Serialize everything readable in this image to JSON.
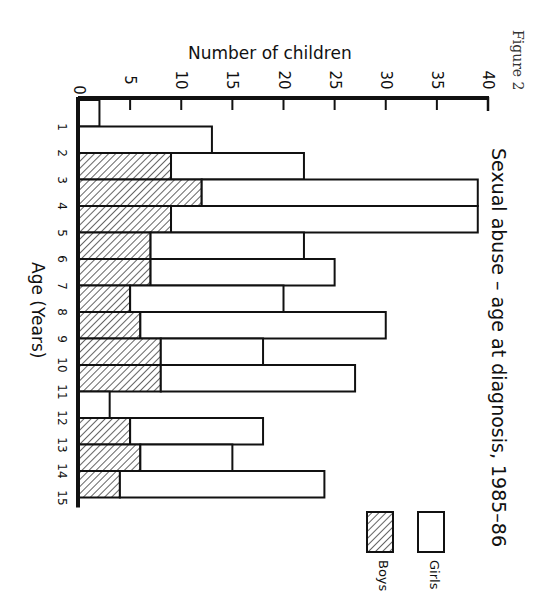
{
  "figure_label": "Figure 2",
  "chart_data": {
    "type": "bar",
    "orientation": "horizontal-stacked (page rotated 90° clockwise)",
    "title": "Sexual abuse – age at diagnosis, 1985–86",
    "xlabel": "Age (Years)",
    "ylabel": "Number of children",
    "ylim": [
      0,
      40
    ],
    "y_ticks": [
      0,
      5,
      10,
      15,
      20,
      25,
      30,
      35,
      40
    ],
    "categories": [
      "0–1",
      "1–2",
      "2–3",
      "3–4",
      "4–5",
      "5–6",
      "6–7",
      "7–8",
      "8–9",
      "9–10",
      "10–11",
      "11–12",
      "12–13",
      "13–14",
      "14–15"
    ],
    "age_tick_labels": [
      "1",
      "2",
      "3",
      "4",
      "5",
      "6",
      "7",
      "8",
      "9",
      "10",
      "11",
      "12",
      "13",
      "14",
      "15"
    ],
    "series": [
      {
        "name": "Boys",
        "pattern": "hatched",
        "values": [
          0,
          0,
          9,
          12,
          9,
          7,
          7,
          5,
          6,
          8,
          8,
          0,
          5,
          6,
          4
        ]
      },
      {
        "name": "Girls",
        "pattern": "white",
        "values": [
          2,
          13,
          13,
          27,
          30,
          15,
          18,
          15,
          24,
          10,
          19,
          3,
          13,
          9,
          20
        ]
      }
    ],
    "totals": [
      2,
      13,
      22,
      39,
      39,
      22,
      25,
      20,
      30,
      18,
      27,
      3,
      18,
      15,
      24
    ],
    "legend": {
      "entries": [
        "Girls",
        "Boys"
      ],
      "position": "bottom-right"
    },
    "grid": false
  },
  "colors": {
    "ink": "#111111",
    "background": "#ffffff",
    "hatch": "#222222"
  }
}
